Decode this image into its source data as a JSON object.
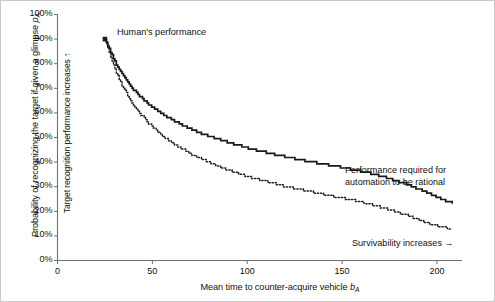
{
  "chart_data": {
    "type": "line",
    "title": "",
    "xlabel": "Mean time to counter-acquire vehicle b_A",
    "ylabel": "Probability of recognizing the target if given a glimpse p_A",
    "ylabel_inner": "Target recognition performance increases ↑",
    "xlim": [
      0,
      215
    ],
    "ylim": [
      0,
      100
    ],
    "xticks": [
      0,
      50,
      100,
      150,
      200
    ],
    "xtick_labels": [
      "0",
      "50",
      "100",
      "150",
      "200"
    ],
    "yticks": [
      0,
      10,
      20,
      30,
      40,
      50,
      60,
      70,
      80,
      90,
      100
    ],
    "ytick_labels": [
      "0%",
      "10%",
      "20%",
      "30%",
      "40%",
      "50%",
      "60%",
      "70%",
      "80%",
      "90%",
      "100%"
    ],
    "grid": false,
    "legend": "none",
    "series": [
      {
        "name": "Performance required for automation to be rational",
        "style": "solid",
        "color": "#1a1a1a",
        "x": [
          25,
          28,
          31,
          34,
          37,
          40,
          44,
          48,
          52,
          56,
          60,
          65,
          70,
          75,
          80,
          86,
          92,
          98,
          104,
          110,
          118,
          126,
          134,
          142,
          150,
          158,
          166,
          175,
          184,
          193,
          202,
          208
        ],
        "y": [
          90,
          84.5,
          79.8,
          75.8,
          72.4,
          69.5,
          66.3,
          63.6,
          61.3,
          59.2,
          57.4,
          55.3,
          53.5,
          51.9,
          50.5,
          48.9,
          47.5,
          46.2,
          45.0,
          43.9,
          42.5,
          41.2,
          40.0,
          38.9,
          37.8,
          36.6,
          35.2,
          33.3,
          31.0,
          28.2,
          25.0,
          23.5
        ]
      },
      {
        "name": "Lower bound curve",
        "style": "dotted",
        "color": "#1a1a1a",
        "x": [
          25,
          28,
          31,
          34,
          37,
          40,
          44,
          48,
          52,
          56,
          60,
          65,
          70,
          75,
          80,
          86,
          92,
          98,
          104,
          110,
          118,
          126,
          134,
          142,
          150,
          158,
          166,
          175,
          184,
          193,
          202,
          208
        ],
        "y": [
          90,
          82.5,
          76.4,
          71.3,
          67.0,
          63.3,
          59.2,
          55.8,
          52.9,
          50.3,
          48.1,
          45.6,
          43.4,
          41.5,
          39.8,
          37.9,
          36.2,
          34.7,
          33.3,
          32.1,
          30.5,
          29.1,
          27.8,
          26.6,
          25.4,
          24.1,
          22.6,
          20.7,
          18.4,
          15.8,
          13.5,
          13.0
        ]
      }
    ],
    "markers": [
      {
        "name": "human-performance-marker",
        "x": 25,
        "y": 90,
        "shape": "square",
        "color": "#1a1a1a",
        "label": "Human's performance"
      }
    ],
    "annotations": [
      {
        "name": "human-performance",
        "text": "Human's performance"
      },
      {
        "name": "performance-required",
        "line1": "Performance required for",
        "line2": "automation to be rational"
      },
      {
        "name": "survivability",
        "text": "Survivability increases →"
      }
    ]
  },
  "axis": {
    "x_label_prefix": "Mean time to counter-acquire vehicle ",
    "x_label_var": "b",
    "x_label_sub": "A",
    "y_label_prefix": "Probability of recognizing the target if given a glimpse ",
    "y_label_var": "p",
    "y_label_sub": "A",
    "y_label_inner": "Target recognition performance increases ↑"
  },
  "colors": {
    "axis": "#6e6e6e",
    "curve": "#1a1a1a",
    "text": "#111111",
    "background": "#ffffff",
    "frame": "#c9c9c9"
  }
}
